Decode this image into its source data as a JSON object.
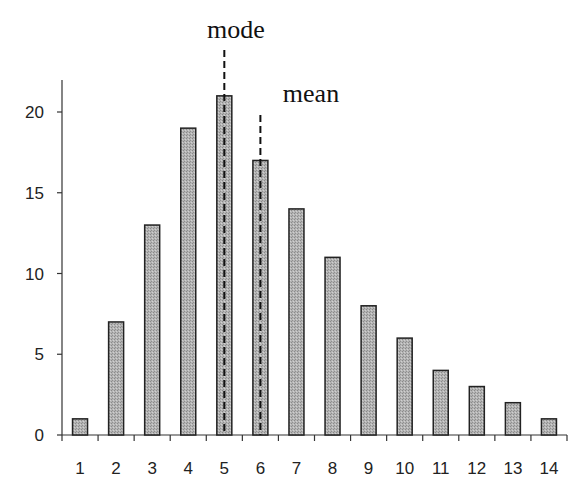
{
  "chart_data": {
    "type": "bar",
    "title": "",
    "xlabel": "",
    "ylabel": "",
    "categories": [
      "1",
      "2",
      "3",
      "4",
      "5",
      "6",
      "7",
      "8",
      "9",
      "10",
      "11",
      "12",
      "13",
      "14"
    ],
    "values": [
      1,
      7,
      13,
      19,
      21,
      17,
      14,
      11,
      8,
      6,
      4,
      3,
      2,
      1
    ],
    "ylim": [
      0,
      22
    ],
    "yticks": [
      0,
      5,
      10,
      15,
      20
    ],
    "grid": false,
    "legend": null,
    "annotations": [
      {
        "label": "mode",
        "x": "5",
        "style": "dashed vertical line"
      },
      {
        "label": "mean",
        "x": "6",
        "style": "dashed vertical line"
      }
    ],
    "bar_color": "#b0b0b0",
    "bar_edge_color": "#222222"
  },
  "annotations": {
    "mode_label": "mode",
    "mean_label": "mean"
  }
}
